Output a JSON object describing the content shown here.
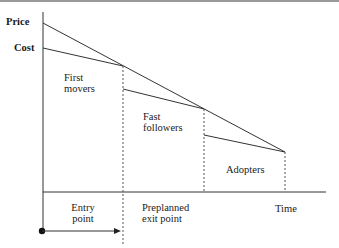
{
  "diagram": {
    "axis_labels": {
      "price": "Price",
      "cost": "Cost",
      "time": "Time"
    },
    "segments": [
      {
        "label": "First movers"
      },
      {
        "label": "Fast followers"
      },
      {
        "label": "Adopters"
      }
    ],
    "segment_labels": {
      "first_line1": "First",
      "first_line2": "movers",
      "fast_line1": "Fast",
      "fast_line2": "followers",
      "adopters": "Adopters"
    },
    "bottom_labels": {
      "entry_line1": "Entry",
      "entry_line2": "point",
      "exit_line1": "Preplanned",
      "exit_line2": "exit point"
    },
    "colors": {
      "line": "#333333",
      "dashed": "#555555",
      "topbar": "#9a9a9a"
    }
  }
}
